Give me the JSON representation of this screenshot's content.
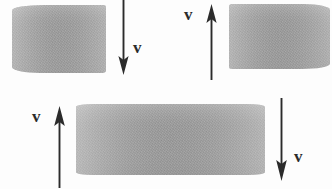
{
  "figure": {
    "background_color": "#fdfdfd",
    "ink_color": "#2b2b2b",
    "block_color": "#a2a2a2",
    "width": 332,
    "height": 189
  },
  "labels": {
    "velocity_top_left": "v",
    "velocity_top_right": "v",
    "velocity_bottom_left": "v",
    "velocity_bottom_right": "v"
  },
  "blocks": [
    {
      "id": "top-left",
      "x": 12,
      "y": 5,
      "w": 94,
      "h": 68,
      "shading": "gray-noise"
    },
    {
      "id": "top-right",
      "x": 229,
      "y": 4,
      "w": 101,
      "h": 65,
      "shading": "gray-noise"
    },
    {
      "id": "bottom-center",
      "x": 76,
      "y": 104,
      "w": 189,
      "h": 71,
      "shading": "gray-noise"
    }
  ],
  "arrows": [
    {
      "id": "top-left-arrow",
      "direction": "down",
      "x": 123,
      "y_start": 0,
      "y_end": 73,
      "label": "v",
      "label_x": 136,
      "label_y": 41
    },
    {
      "id": "top-right-arrow",
      "direction": "up",
      "x": 211,
      "y_start": 5,
      "y_end": 79,
      "label": "v",
      "label_x": 186,
      "label_y": 8
    },
    {
      "id": "bottom-left-arrow",
      "direction": "up",
      "x": 59,
      "y_start": 107,
      "y_end": 186,
      "label": "v",
      "label_x": 34,
      "label_y": 110
    },
    {
      "id": "bottom-right-arrow",
      "direction": "down",
      "x": 281,
      "y_start": 99,
      "y_end": 181,
      "label": "v",
      "label_x": 296,
      "label_y": 150
    }
  ]
}
